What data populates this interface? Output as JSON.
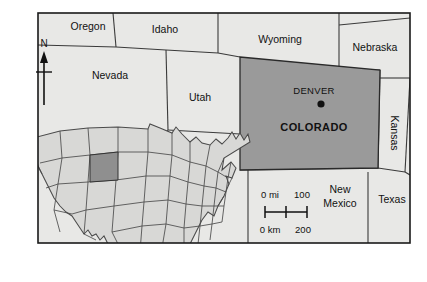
{
  "figure": {
    "kind": "reference-map",
    "background_color": "#ffffff"
  },
  "colors": {
    "frame_line": "#1a1a1a",
    "state_line": "#3a3a3a",
    "panel_fill": "#e8e8e6",
    "focus_fill": "#9a9a9a",
    "inset_fill": "#d8d8d6",
    "inset_focus_fill": "#8f8f8f",
    "inset_line": "#4a4a4a",
    "text": "#111111"
  },
  "main_map": {
    "focus_state": {
      "name": "COLORADO",
      "label": "COLORADO",
      "fill": "#9a9a9a"
    },
    "capital": {
      "name": "DENVER",
      "label": "DENVER",
      "marker": "filled-circle"
    },
    "neighbor_states": [
      {
        "id": "oregon",
        "label": "Oregon",
        "x": 88,
        "y": 27,
        "rotation": 0
      },
      {
        "id": "idaho",
        "label": "Idaho",
        "x": 165,
        "y": 30,
        "rotation": 0
      },
      {
        "id": "wyoming",
        "label": "Wyoming",
        "x": 280,
        "y": 40,
        "rotation": 0
      },
      {
        "id": "nebraska",
        "label": "Nebraska",
        "x": 375,
        "y": 48,
        "rotation": 0
      },
      {
        "id": "nevada",
        "label": "Nevada",
        "x": 110,
        "y": 76,
        "rotation": 0
      },
      {
        "id": "utah",
        "label": "Utah",
        "x": 200,
        "y": 98,
        "rotation": 0
      },
      {
        "id": "kansas",
        "label": "Kansas",
        "x": 394,
        "y": 133,
        "rotation": 90
      },
      {
        "id": "new-mexico-1",
        "label": "New",
        "x": 340,
        "y": 190,
        "rotation": 0
      },
      {
        "id": "new-mexico-2",
        "label": "Mexico",
        "x": 340,
        "y": 204,
        "rotation": 0
      },
      {
        "id": "texas",
        "label": "Texas",
        "x": 392,
        "y": 200,
        "rotation": 0
      }
    ]
  },
  "compass": {
    "label": "N",
    "orientation": "north-arrow"
  },
  "scale_bar": {
    "miles": {
      "zero_label": "0 mi",
      "max_label": "100",
      "unit": "mi",
      "max_value": 100
    },
    "kilometers": {
      "zero_label": "0 km",
      "max_label": "200",
      "unit": "km",
      "max_value": 200
    },
    "tick_count": 3
  },
  "inset_map": {
    "name": "united-states-inset",
    "description": "Continental United States with Colorado highlighted",
    "highlighted_state": "Colorado"
  }
}
